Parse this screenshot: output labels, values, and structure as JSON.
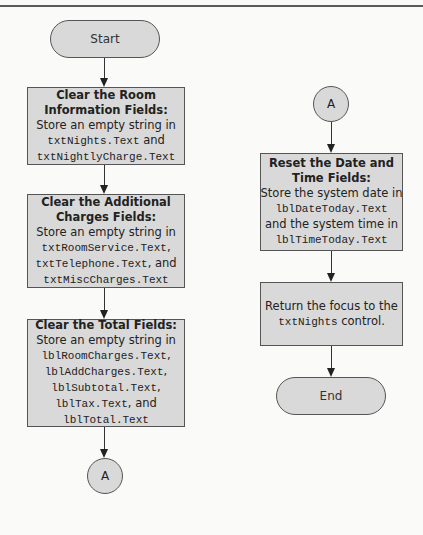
{
  "flowchart": {
    "left_column": {
      "start": {
        "label": "Start"
      },
      "step1": {
        "title_line1": "Clear the Room",
        "title_line2": "Information Fields:",
        "line1": "Store an empty string in",
        "line2_code": "txtNights.Text",
        "line2_tail": " and",
        "line3_code": "txtNightlyCharge.Text"
      },
      "step2": {
        "title_line1": "Clear the Additional",
        "title_line2": "Charges Fields:",
        "line1": "Store an empty string in",
        "line2_code": "txtRoomService.Text",
        "line2_tail": ",",
        "line3_code": "txtTelephone.Text",
        "line3_tail": ", and",
        "line4_code": "txtMiscCharges.Text"
      },
      "step3": {
        "title_line1": "Clear the Total Fields:",
        "line1": "Store an empty string in",
        "line2_code": "lblRoomCharges.Text",
        "line2_tail": ",",
        "line3_code": "lblAddCharges.Text",
        "line3_tail": ",",
        "line4_code": "lblSubtotal.Text",
        "line4_tail": ",",
        "line5_code": "lblTax.Text",
        "line5_tail": ", and",
        "line6_code": "lblTotal.Text"
      },
      "connector_out": {
        "label": "A"
      }
    },
    "right_column": {
      "connector_in": {
        "label": "A"
      },
      "step4": {
        "title_line1": "Reset the Date and",
        "title_line2": "Time Fields:",
        "line1": "Store the system date in",
        "line2_code": "lblDateToday.Text",
        "line3": "and the system time in",
        "line4_code": "lblTimeToday.Text"
      },
      "step5": {
        "line1": "Return the focus to the",
        "line2_code": "txtNights",
        "line2_tail": " control."
      },
      "end": {
        "label": "End"
      }
    },
    "colors": {
      "shape_fill": "#d9d9d9",
      "shape_border": "#555555",
      "background": "#fafaf8",
      "rule": "#5a5a5a"
    }
  }
}
